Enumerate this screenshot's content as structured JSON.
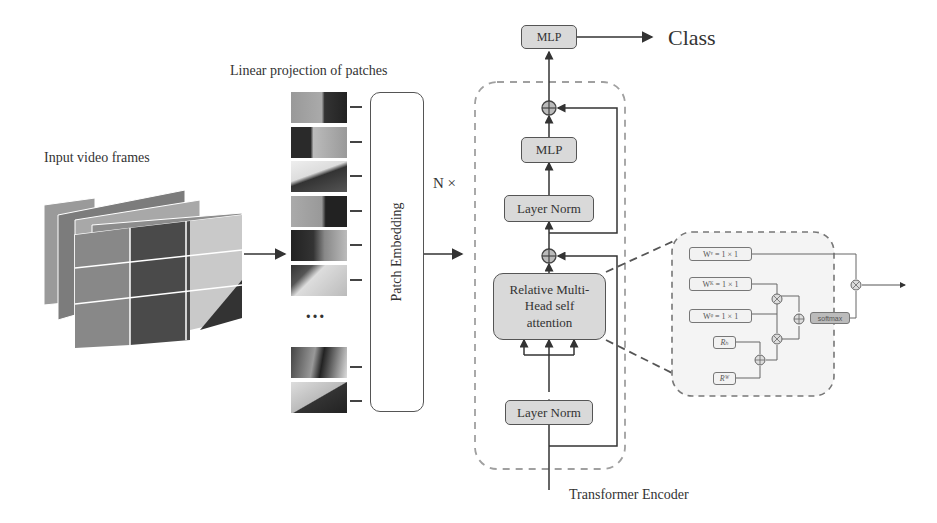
{
  "labels": {
    "input_frames": "Input video frames",
    "linear_projection": "Linear projection of patches",
    "patch_embedding": "Patch Embedding",
    "n_times": "N ×",
    "ellipsis": "…",
    "class": "Class",
    "transformer_encoder": "Transformer Encoder"
  },
  "encoder": {
    "mlp_head": "MLP",
    "mlp": "MLP",
    "layer_norm_top": "Layer Norm",
    "attention": "Relative Multi-Head self attention",
    "layer_norm_bottom": "Layer Norm"
  },
  "attention_detail": {
    "wv": "Wᵛ = 1 × 1",
    "wk": "Wᴷ = 1 × 1",
    "wq": "Wᵠ = 1 × 1",
    "rh": "Rₕ",
    "rw": "Rᵂ",
    "softmax": "softmax"
  },
  "colors": {
    "box_fill": "#d9d9d9",
    "dashed_border": "#999999",
    "line": "#444444"
  }
}
